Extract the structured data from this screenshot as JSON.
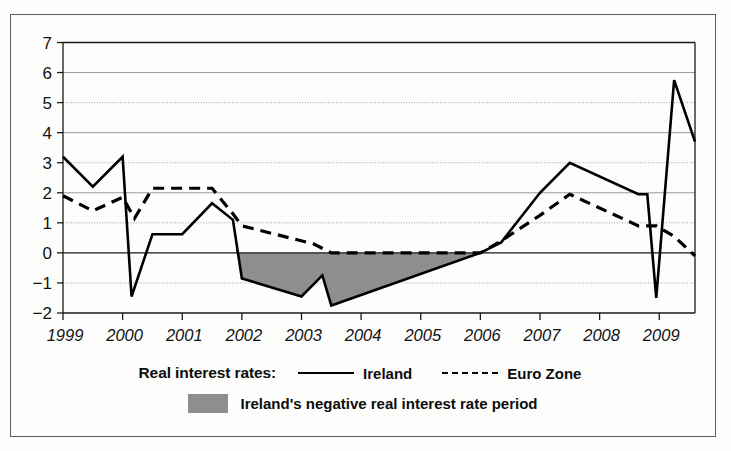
{
  "legend": {
    "title": "Real interest rates:",
    "series": [
      {
        "label": "Ireland",
        "style": "solid"
      },
      {
        "label": "Euro Zone",
        "style": "dashed"
      }
    ],
    "shaded": {
      "label": "Ireland's negative real interest rate period",
      "color": "#8e8e8e"
    }
  },
  "colors": {
    "ireland_line": "#000000",
    "eurozone_line": "#000000",
    "shade": "#8e8e8e",
    "grid": "#9a9a9a",
    "axis": "#1a1a1a",
    "frame": "#5d5d5d",
    "background": "#fdfdfc"
  },
  "chart_data": {
    "type": "line",
    "title": "",
    "subtitle": "",
    "xlabel": "",
    "ylabel": "",
    "xlim": [
      1999.0,
      2009.6
    ],
    "ylim": [
      -2,
      7
    ],
    "yticks": [
      -2,
      -1,
      0,
      1,
      2,
      3,
      4,
      5,
      6,
      7
    ],
    "ytick_labels": [
      "−2",
      "−1",
      "0",
      "1",
      "2",
      "3",
      "4",
      "5",
      "6",
      "7"
    ],
    "xticks": [
      1999,
      2000,
      2001,
      2002,
      2003,
      2004,
      2005,
      2006,
      2007,
      2008,
      2009
    ],
    "xtick_labels": [
      "1999",
      "2000",
      "2001",
      "2002",
      "2003",
      "2004",
      "2005",
      "2006",
      "2007",
      "2008",
      "2009"
    ],
    "grid": true,
    "grid_axis": "y",
    "zero_line": 0,
    "legend_position": "below",
    "series": [
      {
        "name": "Ireland",
        "style": "solid",
        "x": [
          1999.0,
          1999.5,
          2000.0,
          2000.15,
          2000.5,
          2001.0,
          2001.5,
          2001.85,
          2002.0,
          2003.0,
          2003.35,
          2003.5,
          2006.0,
          2006.35,
          2007.0,
          2007.5,
          2008.65,
          2008.8,
          2008.95,
          2009.25,
          2009.6
        ],
        "y": [
          3.2,
          2.2,
          3.2,
          -1.45,
          0.62,
          0.62,
          1.65,
          1.1,
          -0.85,
          -1.45,
          -0.75,
          -1.75,
          0.0,
          0.35,
          2.0,
          3.0,
          1.95,
          1.95,
          -1.5,
          5.75,
          3.7
        ]
      },
      {
        "name": "Euro Zone",
        "style": "dashed",
        "x": [
          1999.0,
          1999.5,
          2000.0,
          2000.2,
          2000.5,
          2001.5,
          2001.85,
          2002.0,
          2003.2,
          2003.5,
          2006.0,
          2006.35,
          2007.0,
          2007.5,
          2008.65,
          2008.95,
          2009.25,
          2009.6
        ],
        "y": [
          1.9,
          1.4,
          1.85,
          1.15,
          2.15,
          2.15,
          1.3,
          0.9,
          0.3,
          0.0,
          0.0,
          0.4,
          1.25,
          1.95,
          0.9,
          0.9,
          0.55,
          -0.1
        ]
      }
    ],
    "shaded_region": {
      "label": "Ireland's negative real interest rate period",
      "x_start": 2001.9,
      "x_end": 2006.0,
      "between": [
        "Ireland",
        "zero"
      ]
    }
  }
}
